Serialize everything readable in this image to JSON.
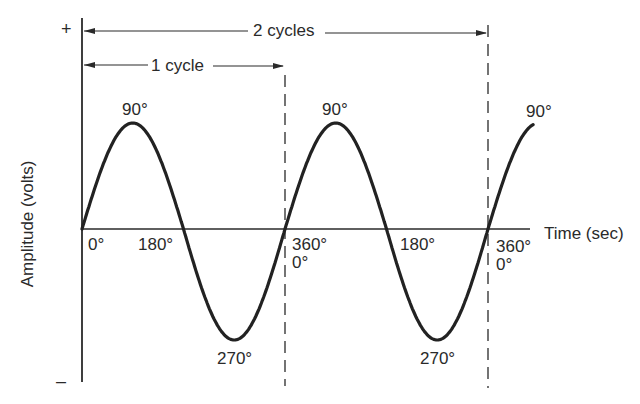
{
  "diagram": {
    "y_axis": {
      "label": "Amplitude (volts)",
      "plus_sign": "+",
      "minus_sign": "–"
    },
    "x_axis": {
      "label": "Time (sec)"
    },
    "spans": {
      "one_cycle": "1 cycle",
      "two_cycles": "2 cycles"
    },
    "phase_labels": {
      "p0_a": "0°",
      "p90_a": "90°",
      "p180_a": "180°",
      "p270_a": "270°",
      "p360_a": "360°",
      "p0_b": "0°",
      "p90_b": "90°",
      "p180_b": "180°",
      "p270_b": "270°",
      "p360_b": "360°",
      "p0_c": "0°",
      "p90_c": "90°"
    },
    "colors": {
      "ink": "#2a2a2a",
      "background": "#ffffff"
    }
  },
  "chart_data": {
    "type": "line",
    "title": "",
    "xlabel": "Time (sec)",
    "ylabel": "Amplitude (volts)",
    "series": [
      {
        "name": "sine wave",
        "x_degrees": [
          0,
          90,
          180,
          270,
          360,
          450,
          540,
          630,
          720,
          810
        ],
        "y_normalized": [
          0,
          1,
          0,
          -1,
          0,
          1,
          0,
          -1,
          0,
          1
        ]
      }
    ],
    "cycles_shown": 2.25,
    "annotations": [
      "1 cycle",
      "2 cycles",
      "+",
      "–"
    ],
    "grid": false
  }
}
